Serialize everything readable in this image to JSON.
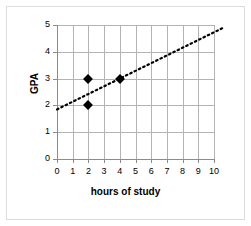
{
  "chart_data": {
    "type": "scatter",
    "title": "",
    "xlabel": "hours of study",
    "ylabel": "GPA",
    "xlim": [
      0,
      10
    ],
    "ylim": [
      0,
      5
    ],
    "xticks": [
      0,
      1,
      2,
      3,
      4,
      5,
      6,
      7,
      8,
      9,
      10
    ],
    "yticks": [
      0,
      1,
      2,
      3,
      4,
      5
    ],
    "xticklabels": [
      "0",
      "1",
      "2",
      "3",
      "4",
      "5",
      "6",
      "7",
      "8",
      "9",
      "10"
    ],
    "yticklabels": [
      "0",
      "1",
      "2",
      "3",
      "4",
      "5"
    ],
    "grid": true,
    "grid_color": "#b3b3b3",
    "legend": false,
    "marker": "diamond",
    "marker_color": "#000000",
    "points": [
      {
        "x": 2,
        "y": 3
      },
      {
        "x": 2,
        "y": 2
      },
      {
        "x": 4,
        "y": 3
      }
    ],
    "trendline": {
      "style": "dotted",
      "color": "#000000",
      "x_start": 0,
      "y_start": 1.85,
      "x_end": 10.6,
      "y_end": 4.9
    },
    "background_color": "#ffffff",
    "border_color": "#dcdcdc"
  }
}
